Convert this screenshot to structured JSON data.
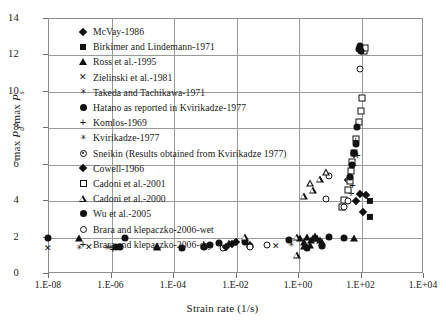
{
  "axes": {
    "xlabel": "Strain rate (1/s)",
    "ylabel_html": "max P_d/max P_s",
    "xticks": [
      "1.E-08",
      "1.E-06",
      "1.E-04",
      "1.E-02",
      "1.E+00",
      "1.E+02",
      "1.E+04"
    ],
    "yticks": [
      "0",
      "2",
      "4",
      "6",
      "8",
      "10",
      "12",
      "14"
    ]
  },
  "legend": [
    {
      "label": "McVay-1986",
      "marker": "filled-diamond"
    },
    {
      "label": "Birkimer and Lindemann-1971",
      "marker": "filled-square"
    },
    {
      "label": "Ross et al.-1995",
      "marker": "filled-triangle"
    },
    {
      "label": "Zielinski et al.-1981",
      "marker": "cross-x"
    },
    {
      "label": "Takeda and Tachikawa-1971",
      "marker": "star-x"
    },
    {
      "label": "Hatano as reported in Kvirikadze-1977",
      "marker": "filled-circle"
    },
    {
      "label": "Komlos-1969",
      "marker": "plus"
    },
    {
      "label": "Kvirikadze-1977",
      "marker": "star-x"
    },
    {
      "label": "Sneikin (Results obtained from Kvirikadze 1977)",
      "marker": "dot-circle"
    },
    {
      "label": "Cowell-1966",
      "marker": "filled-diamond"
    },
    {
      "label": "Cadoni et al.-2001",
      "marker": "open-square"
    },
    {
      "label": "Cadoni et al.-2000",
      "marker": "open-triangle"
    },
    {
      "label": "Wu et al.-2005",
      "marker": "filled-circle"
    },
    {
      "label": "Brara and klepaczko-2006-wet",
      "marker": "open-circle"
    },
    {
      "label": "Brara and klepaczko-2006-dry",
      "marker": "plus"
    }
  ],
  "chart_data": {
    "type": "scatter",
    "title": "",
    "xlabel": "Strain rate (1/s)",
    "ylabel": "max P_d/max P_s",
    "xscale": "log",
    "xlim": [
      1e-08,
      10000.0
    ],
    "ylim": [
      0,
      14
    ],
    "yticks": [
      0,
      2,
      4,
      6,
      8,
      10,
      12,
      14
    ],
    "grid": true,
    "legend_position": "upper-left-inside",
    "series": [
      {
        "name": "McVay-1986",
        "marker": "filled-diamond",
        "points": [
          [
            60,
            6.55
          ],
          [
            95,
            4.35
          ],
          [
            150,
            4.3
          ],
          [
            70,
            3.95
          ],
          [
            120,
            3.35
          ],
          [
            40,
            5.1
          ]
        ]
      },
      {
        "name": "Birkimer and Lindemann-1971",
        "marker": "filled-square",
        "points": [
          [
            200,
            3.95
          ],
          [
            200,
            3.1
          ]
        ]
      },
      {
        "name": "Ross et al.-1995",
        "marker": "filled-triangle",
        "points": [
          [
            1e-07,
            1.95
          ],
          [
            3e-05,
            1.55
          ],
          [
            3e-05,
            1.5
          ],
          [
            0.001,
            1.6
          ],
          [
            0.006,
            1.72
          ],
          [
            0.03,
            1.62
          ],
          [
            1.2,
            1.95
          ],
          [
            2,
            2.05
          ],
          [
            3,
            2.0
          ],
          [
            4,
            1.95
          ],
          [
            5,
            1.85
          ],
          [
            3.5,
            2.08
          ],
          [
            2.6,
            1.88
          ],
          [
            1.5,
            1.75
          ],
          [
            6,
            1.78
          ],
          [
            60,
            1.95
          ],
          [
            1.5,
            1.55
          ],
          [
            2.5,
            1.6
          ]
        ]
      },
      {
        "name": "Zielinski et al.-1981",
        "marker": "cross-x",
        "points": [
          [
            1e-08,
            1.4
          ],
          [
            2e-07,
            1.45
          ],
          [
            0.2,
            1.5
          ]
        ]
      },
      {
        "name": "Takeda and Tachikawa-1971",
        "marker": "star-x",
        "points": [
          [
            1e-06,
            1.35
          ],
          [
            8e-07,
            1.4
          ]
        ]
      },
      {
        "name": "Hatano as reported in Kvirikadze-1977",
        "marker": "filled-circle",
        "points": [
          [
            1e-08,
            1.92
          ],
          [
            3e-06,
            1.92
          ],
          [
            1.5e-06,
            1.45
          ],
          [
            2e-06,
            1.42
          ],
          [
            0.0002,
            1.4
          ],
          [
            0.001,
            1.42
          ],
          [
            0.003,
            1.65
          ],
          [
            0.0015,
            1.55
          ],
          [
            0.02,
            1.72
          ],
          [
            0.03,
            1.48
          ],
          [
            0.5,
            1.82
          ],
          [
            30,
            1.92
          ],
          [
            6,
            1.5
          ],
          [
            2,
            1.35
          ],
          [
            10,
            2.0
          ]
        ]
      },
      {
        "name": "Komlos-1969",
        "marker": "plus",
        "points": [
          [
            1.2e-06,
            1.3
          ],
          [
            55,
            4.85
          ],
          [
            50,
            4.4
          ]
        ]
      },
      {
        "name": "Kvirikadze-1977",
        "marker": "star-x",
        "points": [
          [
            1e-07,
            1.38
          ],
          [
            0.6,
            1.55
          ]
        ]
      },
      {
        "name": "Sneikin (Results obtained from Kvirikadze 1977)",
        "marker": "dot-circle",
        "points": [
          [
            0.004,
            1.4
          ],
          [
            0.1,
            1.55
          ],
          [
            0.03,
            1.45
          ],
          [
            8,
            4.05
          ],
          [
            10,
            5.35
          ]
        ]
      },
      {
        "name": "Cowell-1966",
        "marker": "filled-diamond",
        "points": [
          [
            0.005,
            1.45
          ],
          [
            0.008,
            1.6
          ],
          [
            0.01,
            1.72
          ]
        ]
      },
      {
        "name": "Cadoni et al.-2001",
        "marker": "open-square",
        "points": [
          [
            30,
            4.0
          ],
          [
            40,
            4.55
          ],
          [
            50,
            5.6
          ],
          [
            55,
            6.1
          ],
          [
            60,
            6.6
          ],
          [
            70,
            7.35
          ],
          [
            90,
            8.3
          ],
          [
            110,
            9.6
          ],
          [
            130,
            12.2
          ],
          [
            140,
            12.35
          ],
          [
            25,
            3.6
          ],
          [
            45,
            5.05
          ],
          [
            100,
            8.9
          ]
        ]
      },
      {
        "name": "Cadoni et al.-2000",
        "marker": "open-triangle",
        "points": [
          [
            0.9,
            2.05
          ],
          [
            1.5,
            4.3
          ],
          [
            2.5,
            5.0
          ],
          [
            0.02,
            2.05
          ],
          [
            3,
            4.6
          ],
          [
            0.9,
            1.05
          ],
          [
            5,
            5.2
          ],
          [
            8,
            5.6
          ]
        ]
      },
      {
        "name": "Wu et al.-2005",
        "marker": "filled-circle",
        "points": [
          [
            90,
            12.3
          ],
          [
            95,
            12.45
          ],
          [
            100,
            12.2
          ],
          [
            60,
            6.6
          ],
          [
            70,
            7.1
          ],
          [
            55,
            5.95
          ],
          [
            45,
            5.25
          ],
          [
            80,
            8.0
          ]
        ]
      },
      {
        "name": "Brara and klepaczko-2006-wet",
        "marker": "open-circle",
        "points": [
          [
            95,
            11.2
          ],
          [
            40,
            3.95
          ],
          [
            30,
            3.6
          ]
        ]
      },
      {
        "name": "Brara and klepaczko-2006-dry",
        "marker": "plus",
        "points": [
          [
            80,
            6.5
          ],
          [
            70,
            7.3
          ],
          [
            60,
            5.95
          ]
        ]
      }
    ]
  }
}
